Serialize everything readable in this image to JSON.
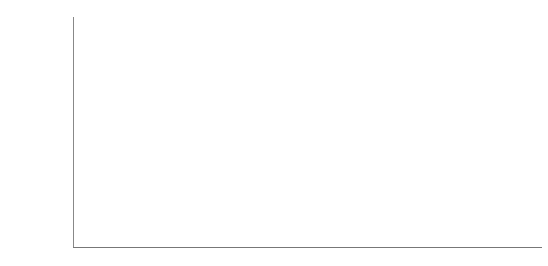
{
  "chart_data": {
    "type": "bar",
    "xlabel": "",
    "ylabel": "Number of deaths",
    "ylim": [
      0,
      45000
    ],
    "yticks": [
      "45,000",
      "40,000",
      "35,000",
      "30,000",
      "25,000",
      "20,000",
      "15,000",
      "10,000",
      "5,000",
      "0"
    ],
    "categories": [
      "Motor vehicles",
      "Home",
      "Public",
      "Work"
    ],
    "values": [
      43200,
      28400,
      19400,
      5100
    ],
    "value_labels": [
      "43,200",
      "28,400",
      "19,400",
      "5,100"
    ],
    "icons": [
      "car-icon",
      "house-icon",
      "climber-icon",
      "factory-icon"
    ],
    "grid": true,
    "legend": null
  },
  "colors": {
    "bar": "#9c9c9c",
    "bar_side": "#6e6e6e",
    "grid": "#e2e2e2",
    "icon": "#111111"
  }
}
